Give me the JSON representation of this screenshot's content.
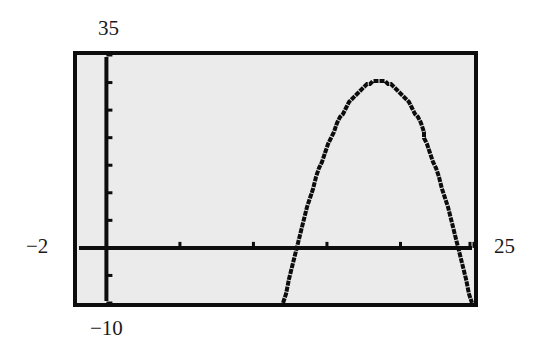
{
  "window": {
    "ymax_label": "35",
    "ymin_label": "−10",
    "xmin_label": "−2",
    "xmax_label": "25"
  },
  "colors": {
    "screen_bg": "#ebebeb",
    "ink": "#0d0d0d"
  },
  "chart_data": {
    "type": "line",
    "title": "",
    "xlabel": "",
    "ylabel": "",
    "xlim": [
      -2,
      25
    ],
    "ylim": [
      -10,
      35
    ],
    "xscl": 5,
    "yscl": 5,
    "grid": false,
    "legend": null,
    "series": [
      {
        "name": "y = -(x - 13)(x - 24)",
        "x": [
          12.1,
          13,
          14,
          15,
          16,
          17,
          18,
          18.5,
          19,
          20,
          21,
          22,
          23,
          24,
          24.9
        ],
        "y": [
          -10,
          0,
          10,
          18,
          24,
          28,
          30,
          30.25,
          30,
          28,
          24,
          18,
          10,
          0,
          -10
        ]
      }
    ],
    "annotations": [
      "35",
      "-10",
      "-2",
      "25"
    ]
  }
}
